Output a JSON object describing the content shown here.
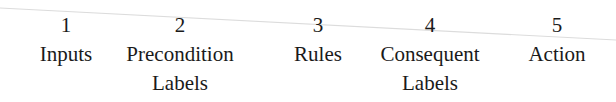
{
  "diagram": {
    "columns": [
      {
        "number": "1",
        "lines": [
          "Inputs"
        ],
        "center_x": 66
      },
      {
        "number": "2",
        "lines": [
          "Precondition",
          "Labels"
        ],
        "center_x": 180
      },
      {
        "number": "3",
        "lines": [
          "Rules"
        ],
        "center_x": 318
      },
      {
        "number": "4",
        "lines": [
          "Consequent",
          "Labels"
        ],
        "center_x": 430
      },
      {
        "number": "5",
        "lines": [
          "Action"
        ],
        "center_x": 557
      }
    ],
    "colors": {
      "text": "#1a1a1a",
      "background": "#ffffff",
      "scan_line": "#d8d8d8"
    }
  }
}
